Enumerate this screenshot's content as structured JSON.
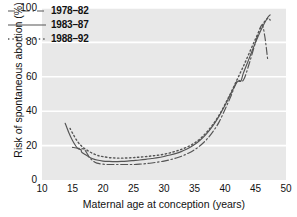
{
  "chart_data": {
    "type": "line",
    "title": "",
    "xlabel": "Maternal age at conception (years)",
    "ylabel": "Risk of spontaneous abortion (%)",
    "xlim": [
      10,
      50
    ],
    "ylim": [
      0,
      100
    ],
    "xticks": [
      "10",
      "15",
      "20",
      "25",
      "30",
      "35",
      "40",
      "45",
      "50"
    ],
    "yticks": [
      "0",
      "20",
      "40",
      "60",
      "80",
      "100"
    ],
    "grid": "horizontal-white-gridlines",
    "legend_position": "top-left-inside",
    "plot_background": "#e8e8e8",
    "line_color": "#555555",
    "series": [
      {
        "name": "1978–82",
        "style": "dash-dot",
        "x": [
          15.0,
          15.6,
          16.2,
          16.8,
          17.3,
          17.8,
          18.4,
          19.0,
          20.0,
          21.0,
          22.0,
          23.0,
          24.0,
          25.0,
          26.0,
          27.0,
          28.0,
          29.0,
          30.0,
          31.0,
          32.0,
          33.0,
          34.0,
          35.0,
          36.0,
          37.0,
          38.0,
          39.0,
          40.0,
          41.0,
          42.0,
          43.0,
          44.0,
          45.0,
          46.0,
          46.5,
          47.0
        ],
        "values": [
          19.0,
          18.6,
          18.3,
          18.0,
          16.0,
          13.0,
          11.0,
          9.8,
          9.2,
          9.0,
          9.0,
          9.0,
          9.0,
          9.0,
          9.2,
          9.5,
          9.9,
          10.4,
          11.0,
          11.8,
          12.8,
          14.0,
          15.6,
          17.6,
          20.2,
          23.6,
          28.0,
          33.5,
          41.0,
          49.0,
          57.5,
          58.0,
          68.0,
          80.0,
          90.0,
          84.0,
          70.0
        ]
      },
      {
        "name": "1983–87",
        "style": "solid",
        "x": [
          13.8,
          14.4,
          15.0,
          15.6,
          16.0,
          16.4,
          16.5,
          17.0,
          17.6,
          18.2,
          19.0,
          20.0,
          21.0,
          22.0,
          23.0,
          24.0,
          25.0,
          26.0,
          27.0,
          28.0,
          29.0,
          30.0,
          31.0,
          32.0,
          33.0,
          34.0,
          35.0,
          36.0,
          37.0,
          38.0,
          39.0,
          40.0,
          41.0,
          42.0,
          42.6,
          43.0,
          44.0,
          45.0,
          46.0,
          47.0,
          47.4
        ],
        "values": [
          33.0,
          27.5,
          23.0,
          19.5,
          18.0,
          17.6,
          16.2,
          15.0,
          13.6,
          12.5,
          11.6,
          11.0,
          10.8,
          10.7,
          10.8,
          11.0,
          11.3,
          11.6,
          12.0,
          12.5,
          13.0,
          13.7,
          14.5,
          15.5,
          16.8,
          18.4,
          20.6,
          23.4,
          27.0,
          31.5,
          37.0,
          43.5,
          50.5,
          57.0,
          57.5,
          62.0,
          71.0,
          80.0,
          88.0,
          94.5,
          96.0
        ]
      },
      {
        "name": "1988–92",
        "style": "dotted",
        "x": [
          14.6,
          15.2,
          15.8,
          16.4,
          17.0,
          17.8,
          18.6,
          19.4,
          20.0,
          21.0,
          22.0,
          23.0,
          24.0,
          25.0,
          26.0,
          27.0,
          28.0,
          29.0,
          30.0,
          31.0,
          32.0,
          33.0,
          34.0,
          35.0,
          36.0,
          37.0,
          38.0,
          39.0,
          40.0,
          41.0,
          42.0,
          43.0,
          44.0,
          45.0,
          46.0,
          47.0,
          47.4
        ],
        "values": [
          30.0,
          26.0,
          22.5,
          20.0,
          18.2,
          16.4,
          15.0,
          14.0,
          13.6,
          13.0,
          12.8,
          12.7,
          12.8,
          13.0,
          13.3,
          13.6,
          14.0,
          14.4,
          15.0,
          15.8,
          16.8,
          18.0,
          19.5,
          21.5,
          24.2,
          27.8,
          32.2,
          37.5,
          44.0,
          51.0,
          58.5,
          66.0,
          74.0,
          82.0,
          89.5,
          94.0,
          93.0
        ]
      }
    ]
  }
}
